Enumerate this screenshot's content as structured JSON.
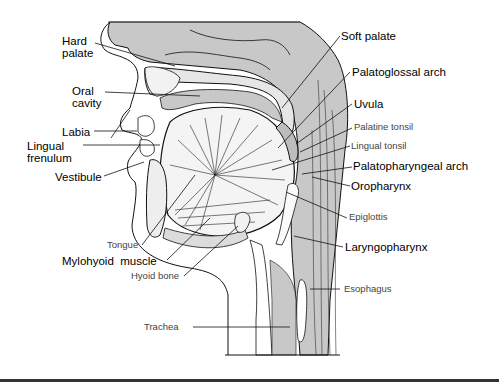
{
  "figure": {
    "colors": {
      "background": "#ffffff",
      "tissue_fill": "#c8c8c8",
      "outline": "#111111",
      "bone_fill": "#e6e6e6"
    }
  },
  "labels": {
    "hard_palate": "Hard\npalate",
    "oral_cavity": "Oral\ncavity",
    "labia": "Labia",
    "lingual_frenulum": "Lingual\nfrenulum",
    "vestibule": "Vestibule",
    "tongue": "Tongue",
    "mylohyoid_muscle": "Mylohyoid  muscle",
    "hyoid_bone": "Hyoid bone",
    "trachea": "Trachea",
    "soft_palate": "Soft palate",
    "palatoglossal_arch": "Palatoglossal arch",
    "uvula": "Uvula",
    "palatine_tonsil": "Palatine tonsil",
    "lingual_tonsil": "Lingual tonsil",
    "palatopharyngeal_arch": "Palatopharyngeal arch",
    "oropharynx": "Oropharynx",
    "epiglottis": "Epiglottis",
    "laryngopharynx": "Laryngopharynx",
    "esophagus": "Esophagus"
  }
}
